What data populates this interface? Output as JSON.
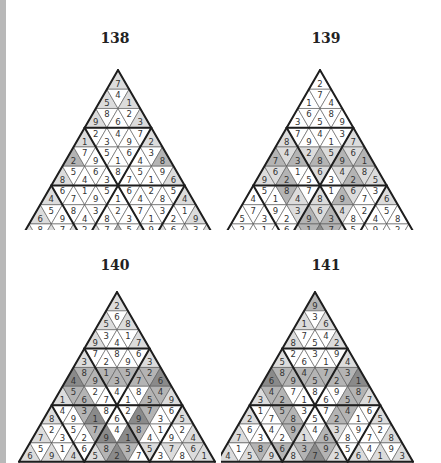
{
  "colors": {
    "white": "#ffffff",
    "light": "#dcdcdc",
    "mid": "#b4b4b4",
    "dark": "#8a8a8a",
    "line_thin": "#555555",
    "line_thick": "#1e1e1e",
    "edge_strip": "#b8b8b8"
  },
  "puzzles": [
    {
      "number": "138",
      "rows": [
        [
          7
        ],
        [
          5,
          4,
          1
        ],
        [
          9,
          8,
          6,
          2,
          3
        ],
        [
          1,
          2,
          3,
          4,
          9,
          7,
          2
        ],
        [
          2,
          7,
          9,
          5,
          1,
          6,
          4,
          3,
          8
        ],
        [
          8,
          5,
          4,
          6,
          3,
          8,
          7,
          5,
          1,
          9,
          6
        ],
        [
          4,
          6,
          7,
          1,
          9,
          5,
          1,
          6,
          4,
          2,
          8,
          5,
          4
        ],
        [
          6,
          5,
          9,
          8,
          4,
          3,
          8,
          2,
          3,
          7,
          1,
          3,
          2,
          1,
          9
        ],
        [
          3,
          8,
          2,
          7,
          1,
          2,
          9,
          7,
          6,
          5,
          4,
          9,
          8,
          6,
          7,
          3,
          5
        ]
      ],
      "shade": [
        "L",
        "LWL",
        "LWWWL",
        "LWWWWWL",
        "MWWWWWWWM",
        "LWWWWWWWWWL",
        "LWWWWWWWWWWWL",
        "LWWWWWWWWWWWWWL",
        "LWLWLWLWMWLWLWLWL"
      ]
    },
    {
      "number": "139",
      "rows": [
        [
          2
        ],
        [
          1,
          7,
          4
        ],
        [
          3,
          6,
          5,
          8,
          9
        ],
        [
          8,
          7,
          9,
          4,
          1,
          3,
          7
        ],
        [
          7,
          4,
          3,
          2,
          8,
          5,
          9,
          6,
          1
        ],
        [
          9,
          6,
          2,
          1,
          5,
          6,
          3,
          4,
          2,
          8,
          5
        ],
        [
          4,
          5,
          1,
          8,
          4,
          7,
          8,
          1,
          9,
          6,
          7,
          3,
          6
        ],
        [
          5,
          7,
          3,
          9,
          2,
          3,
          9,
          6,
          3,
          4,
          8,
          2,
          4,
          5,
          8
        ],
        [
          6,
          2,
          9,
          1,
          8,
          6,
          4,
          1,
          5,
          7,
          2,
          5,
          7,
          9,
          1,
          2,
          3
        ]
      ],
      "shade": [
        "W",
        "WWW",
        "WWWWW",
        "LWWWWWL",
        "MLMLMLMLM",
        "LLMWWLWLMLL",
        "WWWMLWLWMLWWL",
        "WWWWWLMLMLWWWWW",
        "WWWWWWLMDMLWWWWWW"
      ]
    },
    {
      "number": "140",
      "rows": [
        [
          2
        ],
        [
          5,
          6,
          8
        ],
        [
          9,
          3,
          4,
          1,
          7
        ],
        [
          3,
          7,
          2,
          8,
          9,
          6,
          3
        ],
        [
          4,
          8,
          9,
          1,
          3,
          5,
          7,
          2,
          6
        ],
        [
          1,
          5,
          6,
          2,
          7,
          4,
          1,
          8,
          5,
          4,
          9
        ],
        [
          8,
          4,
          9,
          3,
          1,
          8,
          6,
          2,
          9,
          7,
          3,
          6,
          5
        ],
        [
          7,
          2,
          3,
          5,
          2,
          7,
          9,
          4,
          1,
          8,
          4,
          1,
          9,
          2,
          4
        ],
        [
          6,
          5,
          9,
          1,
          4,
          6,
          5,
          8,
          2,
          3,
          7,
          5,
          3,
          7,
          8,
          6,
          1
        ]
      ],
      "shade": [
        "L",
        "LWL",
        "LWWWL",
        "LWWWWWL",
        "DMMMMMMMD",
        "LMMWWWWWMML",
        "LWWMDWWWDMWWL",
        "LWWWWMDWDMWWWWL",
        "LWLWLWLMDMWLWLWLL"
      ]
    },
    {
      "number": "141",
      "rows": [
        [
          9
        ],
        [
          1,
          3,
          6
        ],
        [
          8,
          7,
          5,
          4,
          2
        ],
        [
          5,
          2,
          6,
          3,
          1,
          9,
          4
        ],
        [
          6,
          8,
          9,
          4,
          5,
          7,
          2,
          3,
          1
        ],
        [
          3,
          4,
          2,
          7,
          1,
          8,
          6,
          9,
          5,
          8,
          7
        ],
        [
          2,
          1,
          7,
          5,
          8,
          3,
          5,
          7,
          2,
          4,
          1,
          6,
          5
        ],
        [
          7,
          6,
          3,
          4,
          2,
          9,
          1,
          4,
          6,
          3,
          8,
          9,
          7,
          2,
          8
        ],
        [
          4,
          1,
          5,
          8,
          9,
          6,
          8,
          3,
          7,
          9,
          2,
          5,
          6,
          4,
          1,
          9,
          3
        ]
      ],
      "shade": [
        "M",
        "LWL",
        "LWWWL",
        "LWWWWWL",
        "DMMMMMMMD",
        "LMMWWWWWMML",
        "LWWMMWWWMMWWL",
        "LWWWWMLWMLWWWWL",
        "LWLMLMLMDMLWLWLWL"
      ]
    }
  ]
}
